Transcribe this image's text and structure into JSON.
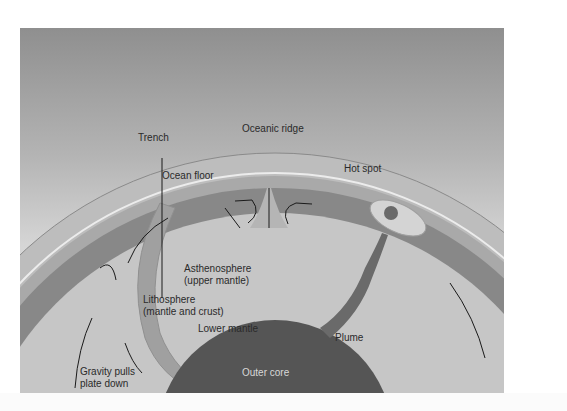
{
  "figure": {
    "labels": {
      "trench": "Trench",
      "oceanic_ridge": "Oceanic ridge",
      "ocean_floor": "Ocean floor",
      "hot_spot": "Hot spot",
      "asthenosphere_1": "Asthenosphere",
      "asthenosphere_2": "(upper mantle)",
      "lithosphere_1": "Lithosphere",
      "lithosphere_2": "(mantle and crust)",
      "lower_mantle": "Lower mantle",
      "plume": "Plume",
      "outer_core": "Outer core",
      "gravity_1": "Gravity pulls",
      "gravity_2": "plate down"
    },
    "colors": {
      "sky_top": "#8f8f8f",
      "sky_bottom": "#e2e2e2",
      "crust": "#b9b9b9",
      "lithosphere": "#a8a8a8",
      "asthenosphere": "#8a8a8a",
      "lower_mantle": "#c6c6c6",
      "outer_core": "#555555",
      "inner_core": "#f0f0f0",
      "hot_spot": "#d2d2d2"
    }
  }
}
